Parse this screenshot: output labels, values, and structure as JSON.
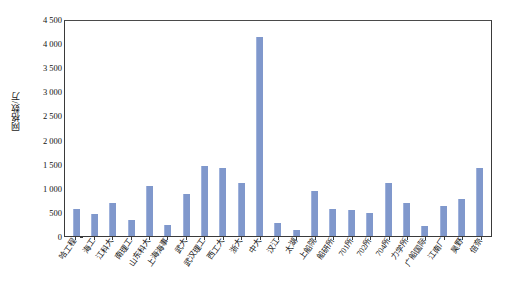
{
  "chart_data": {
    "type": "bar",
    "title": "",
    "subtitle": "",
    "xlabel": "",
    "ylabel": "网格数/万",
    "ylim": [
      0,
      4500
    ],
    "ytick_labels": [
      "4 500",
      "4 000",
      "3 500",
      "3 000",
      "2 500",
      "2 000",
      "1 500",
      "1 000",
      "500",
      "0"
    ],
    "ytick_values": [
      4500,
      4000,
      3500,
      3000,
      2500,
      2000,
      1500,
      1000,
      500,
      0
    ],
    "grid": false,
    "legend": false,
    "bar_color": "#8098cc",
    "categories": [
      "哈工程",
      "海工",
      "江科大",
      "南理工",
      "山东科大",
      "上海海事",
      "武大",
      "武汉理工",
      "西工大",
      "浙大",
      "中大",
      "汉江",
      "太湖",
      "上船院",
      "船研所",
      "701所",
      "702所",
      "704所",
      "力学所",
      "广船国际",
      "江南厂",
      "昊野",
      "倍奈"
    ],
    "values": [
      570,
      455,
      690,
      330,
      1030,
      225,
      880,
      1460,
      1410,
      1100,
      4120,
      270,
      120,
      930,
      560,
      540,
      480,
      1100,
      690,
      200,
      630,
      760,
      1420
    ]
  },
  "axis": {
    "y_title": "网格数/万"
  }
}
